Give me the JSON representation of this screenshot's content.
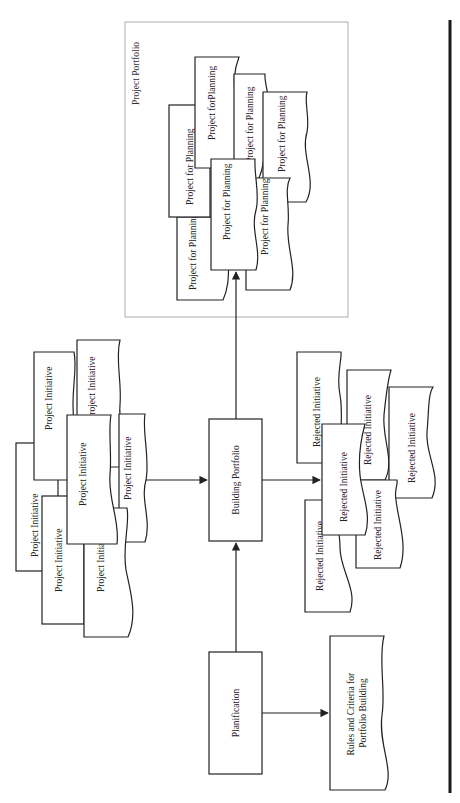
{
  "diagram": {
    "orientation": "rotated-90-ccw",
    "colors": {
      "stroke": "#222222",
      "frame": "#9a9a9a",
      "background": "#ffffff"
    },
    "portfolio_group": {
      "label": "Project Portfolio",
      "items": [
        "Project for Planning",
        "Project for Planning",
        "Project forPlanning",
        "Project for Planning",
        "Project for Planning",
        "Project for Planning",
        "Project for Planning"
      ]
    },
    "initiatives": [
      "Project Initiative",
      "Project Initiative",
      "Project Initiative",
      "Project Initiative",
      "Project Initiative",
      "Project Initiative",
      "Project Initiative"
    ],
    "process_building": "Building Portfolio",
    "process_planification": "Planification",
    "rules_document": "Rules and Criteria for Portfolio Building",
    "rejected": [
      "Rejected Initiative",
      "Rejected Initiative",
      "Rejected Initiative",
      "Rejected Initiative",
      "Rejected Initiative",
      "Rejected Initiative"
    ],
    "edges": [
      {
        "from": "Project Initiative",
        "to": "Building Portfolio"
      },
      {
        "from": "Planification",
        "to": "Building Portfolio"
      },
      {
        "from": "Planification",
        "to": "Rules and Criteria for Portfolio Building"
      },
      {
        "from": "Building Portfolio",
        "to": "Project Portfolio"
      },
      {
        "from": "Building Portfolio",
        "to": "Rejected Initiative"
      }
    ]
  }
}
